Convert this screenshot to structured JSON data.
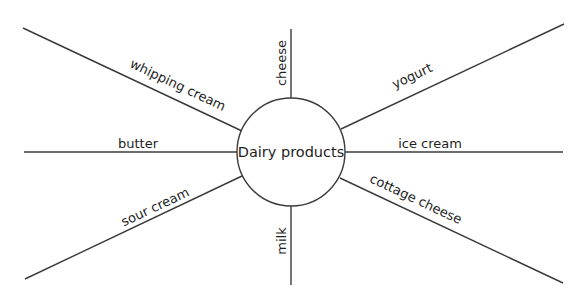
{
  "diagram": {
    "type": "spider-map",
    "canvas": {
      "width": 588,
      "height": 297,
      "background": "#ffffff"
    },
    "line_color": "#3a3a3a",
    "text_color": "#1e1e1e",
    "hub": {
      "label": "Dairy products",
      "cx": 291,
      "cy": 152,
      "r": 54
    },
    "spokes": [
      {
        "id": "whipping-cream",
        "label": "whipping cream",
        "x1": 23,
        "y1": 28,
        "x2": 242,
        "y2": 131,
        "label_x": 176,
        "label_y": 89,
        "label_angle": 25.2
      },
      {
        "id": "cheese",
        "label": "cheese",
        "x1": 291,
        "y1": 29,
        "x2": 291,
        "y2": 98,
        "label_x": 286,
        "label_y": 63,
        "label_angle": -90
      },
      {
        "id": "yogurt",
        "label": "yogurt",
        "x1": 341,
        "y1": 129,
        "x2": 564,
        "y2": 24,
        "label_x": 414,
        "label_y": 80,
        "label_angle": -25.2
      },
      {
        "id": "butter",
        "label": "butter",
        "x1": 24,
        "y1": 152,
        "x2": 237,
        "y2": 152,
        "label_x": 138,
        "label_y": 148,
        "label_angle": 0
      },
      {
        "id": "ice-cream",
        "label": "ice cream",
        "x1": 345,
        "y1": 152,
        "x2": 563,
        "y2": 152,
        "label_x": 430,
        "label_y": 148,
        "label_angle": 0
      },
      {
        "id": "sour-cream",
        "label": "sour cream",
        "x1": 25,
        "y1": 279,
        "x2": 242,
        "y2": 176,
        "label_x": 157,
        "label_y": 211,
        "label_angle": -25.2
      },
      {
        "id": "milk",
        "label": "milk",
        "x1": 291,
        "y1": 206,
        "x2": 291,
        "y2": 285,
        "label_x": 286,
        "label_y": 241,
        "label_angle": -90
      },
      {
        "id": "cottage-cheese",
        "label": "cottage cheese",
        "x1": 340,
        "y1": 178,
        "x2": 563,
        "y2": 283,
        "label_x": 414,
        "label_y": 203,
        "label_angle": 25.2
      }
    ]
  }
}
